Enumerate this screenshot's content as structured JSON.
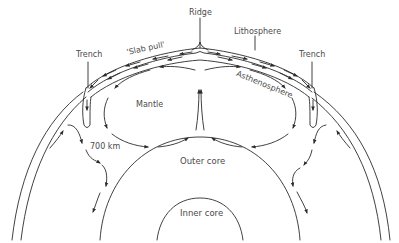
{
  "labels": {
    "ridge": "Ridge",
    "lithosphere": "Lithosphere",
    "trench_left": "Trench",
    "trench_right": "Trench",
    "slab_pull": "'Slab pull'",
    "asthenosphere": "Asthenosphere",
    "mantle": "Mantle",
    "depth": "700 km",
    "outer_core": "Outer core",
    "inner_core": "Inner core"
  },
  "colors": {
    "line": "#2b2b2b",
    "text": "#4a4a4a",
    "background": "#ffffff"
  }
}
